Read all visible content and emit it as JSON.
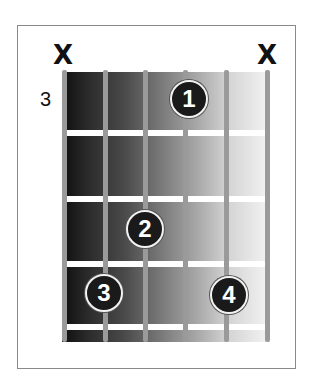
{
  "diagram": {
    "type": "guitar-chord-diagram",
    "starting_fret_label": "3",
    "strings": 6,
    "frets_shown": 4,
    "muted_strings": [
      {
        "string": 6,
        "label": "X"
      },
      {
        "string": 1,
        "label": "X"
      }
    ],
    "fingers": [
      {
        "label": "1",
        "string": 3,
        "fret": 1
      },
      {
        "label": "2",
        "string": 4,
        "fret": 2
      },
      {
        "label": "3",
        "string": 5,
        "fret": 3
      },
      {
        "label": "4",
        "string": 2,
        "fret": 3
      }
    ],
    "colors": {
      "finger_fill": "#1a1a1a",
      "finger_text": "#ffffff",
      "string": "#9a9a9a",
      "fret": "#ffffff",
      "gradient_dark": "#0e0e0e",
      "gradient_light": "#f4f4f4"
    }
  }
}
